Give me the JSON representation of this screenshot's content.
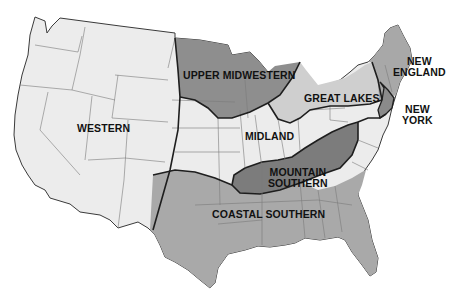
{
  "map": {
    "title": "US dialect regions",
    "colors": {
      "western": "#ececec",
      "midland": "#ececec",
      "upper_midwestern": "#8e8e8e",
      "great_lakes": "#cfcfcf",
      "new_england": "#a8a8a8",
      "new_york": "#8a8a8a",
      "mountain_southern": "#7c7c7c",
      "coastal_southern": "#a9a9a9",
      "state_border": "#6e6e6e",
      "region_border": "#1e1e1e"
    },
    "regions": [
      {
        "id": "western",
        "label": "WESTERN"
      },
      {
        "id": "upper_midwestern",
        "label": "UPPER MIDWESTERN"
      },
      {
        "id": "great_lakes",
        "label": "GREAT LAKES"
      },
      {
        "id": "new_england",
        "label_line1": "NEW",
        "label_line2": "ENGLAND"
      },
      {
        "id": "new_york",
        "label_line1": "NEW",
        "label_line2": "YORK"
      },
      {
        "id": "midland",
        "label": "MIDLAND"
      },
      {
        "id": "mountain_southern",
        "label_line1": "MOUNTAIN",
        "label_line2": "SOUTHERN"
      },
      {
        "id": "coastal_southern",
        "label": "COASTAL SOUTHERN"
      }
    ]
  }
}
